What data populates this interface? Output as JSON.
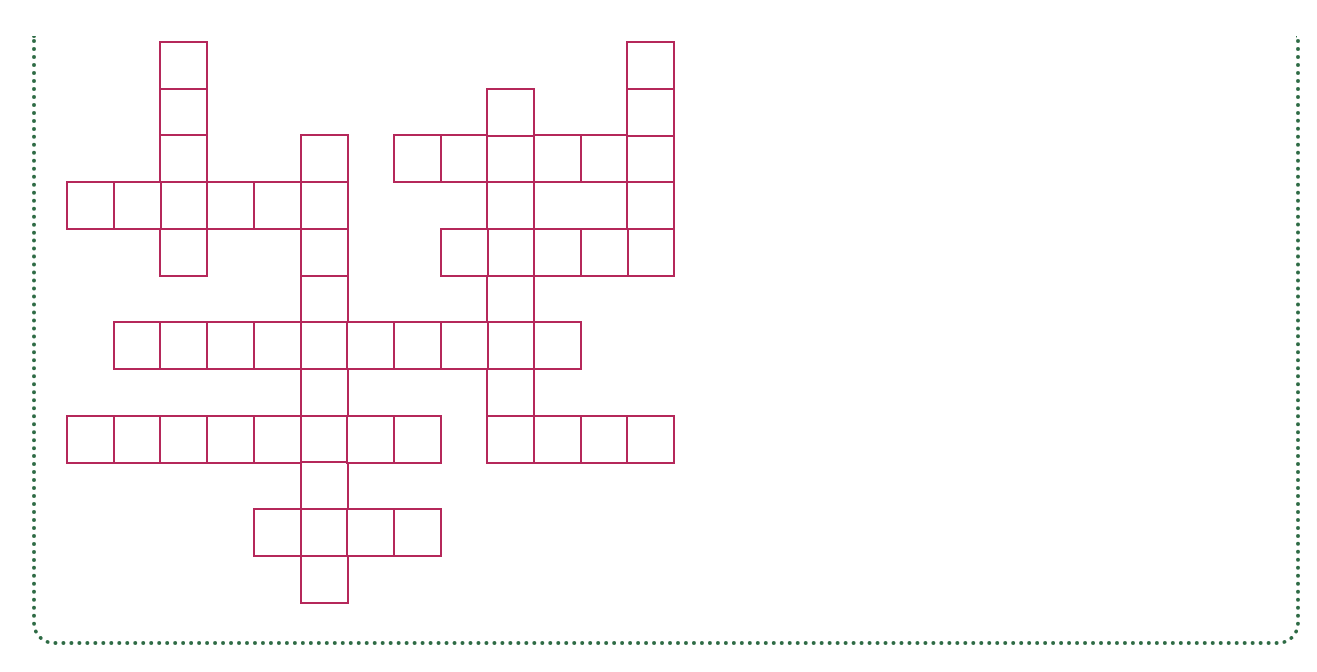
{
  "puzzle": {
    "type": "crossword-grid",
    "cell_size": 46.7,
    "origin": {
      "x": 66,
      "y": 41
    },
    "line_color": "#b5285a",
    "border_color": "#2e6b45",
    "words": [
      {
        "id": "v1",
        "direction": "down",
        "col": 2,
        "row": 0,
        "length": 5
      },
      {
        "id": "h1",
        "direction": "across",
        "col": 0,
        "row": 3,
        "length": 6
      },
      {
        "id": "v2",
        "direction": "down",
        "col": 5,
        "row": 2,
        "length": 10
      },
      {
        "id": "h2",
        "direction": "across",
        "col": 7,
        "row": 2,
        "length": 6
      },
      {
        "id": "v3",
        "direction": "down",
        "col": 9,
        "row": 1,
        "length": 8
      },
      {
        "id": "v4",
        "direction": "down",
        "col": 12,
        "row": 0,
        "length": 5
      },
      {
        "id": "h3",
        "direction": "across",
        "col": 8,
        "row": 4,
        "length": 5
      },
      {
        "id": "h4",
        "direction": "across",
        "col": 1,
        "row": 6,
        "length": 10
      },
      {
        "id": "h5",
        "direction": "across",
        "col": 0,
        "row": 8,
        "length": 8
      },
      {
        "id": "h6",
        "direction": "across",
        "col": 9,
        "row": 8,
        "length": 4
      },
      {
        "id": "h7",
        "direction": "across",
        "col": 4,
        "row": 10,
        "length": 4
      }
    ]
  }
}
